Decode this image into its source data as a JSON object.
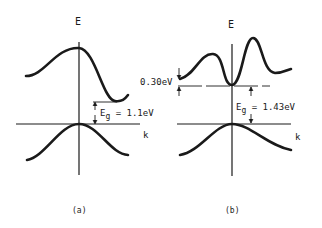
{
  "diagram": {
    "type": "band-structure",
    "panels": [
      {
        "id": "a",
        "caption": "(a)",
        "axis_energy_label": "E",
        "axis_k_label": "k",
        "gap_label": "E",
        "gap_subscript": "g",
        "gap_value": " = 1.1eV",
        "band_gap_eV": 1.1,
        "gap_type": "indirect"
      },
      {
        "id": "b",
        "caption": "(b)",
        "axis_energy_label": "E",
        "axis_k_label": "k",
        "gap_label": "E",
        "gap_subscript": "g",
        "gap_value": " = 1.43eV",
        "band_gap_eV": 1.43,
        "side_valley_label": "0.30eV",
        "side_valley_offset_eV": 0.3,
        "gap_type": "direct"
      }
    ],
    "stroke_color": "#1a1a1a"
  }
}
